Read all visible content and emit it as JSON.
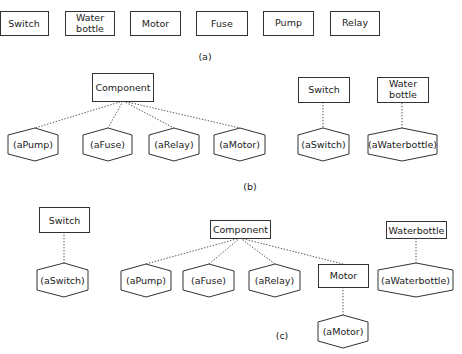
{
  "panel_a": {
    "caption": "(a)",
    "classes": [
      {
        "label": "Switch",
        "lines": [
          "Switch"
        ]
      },
      {
        "label": "Water bottle",
        "lines": [
          "Water",
          "bottle"
        ]
      },
      {
        "label": "Motor",
        "lines": [
          "Motor"
        ]
      },
      {
        "label": "Fuse",
        "lines": [
          "Fuse"
        ]
      },
      {
        "label": "Pump",
        "lines": [
          "Pump"
        ]
      },
      {
        "label": "Relay",
        "lines": [
          "Relay"
        ]
      }
    ]
  },
  "panel_b": {
    "caption": "(b)",
    "classes": {
      "component": "Component",
      "switch": "Switch",
      "water_bottle_line1": "Water",
      "water_bottle_line2": "bottle"
    },
    "instances": {
      "pump": "(aPump)",
      "fuse": "(aFuse)",
      "relay": "(aRelay)",
      "motor": "(aMotor)",
      "switch": "(aSwitch)",
      "waterbottle": "(aWaterbottle)"
    }
  },
  "panel_c": {
    "caption": "(c)",
    "classes": {
      "switch": "Switch",
      "component": "Component",
      "motor": "Motor",
      "waterbottle": "Waterbottle"
    },
    "instances": {
      "switch": "(aSwitch)",
      "pump": "(aPump)",
      "fuse": "(aFuse)",
      "relay": "(aRelay)",
      "motor": "(aMotor)",
      "waterbottle": "(aWaterbottle)"
    }
  }
}
